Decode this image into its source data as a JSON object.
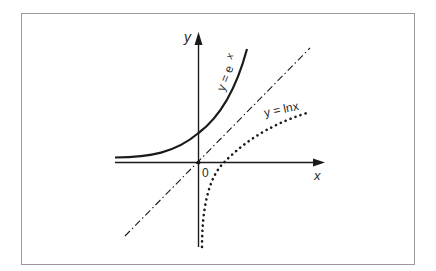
{
  "figure": {
    "frame_color": "#9a9a9a",
    "ink_color": "#1a1a1a",
    "axes": {
      "x_label": "x",
      "y_label": "y",
      "origin_label": "0"
    },
    "curves": [
      {
        "name": "exponential",
        "label": "y = e",
        "superscript": "x",
        "style": "solid"
      },
      {
        "name": "logarithm",
        "label": "y = lnx",
        "style": "dotted"
      },
      {
        "name": "identity-line",
        "label": "",
        "style": "dash-dot"
      }
    ]
  }
}
